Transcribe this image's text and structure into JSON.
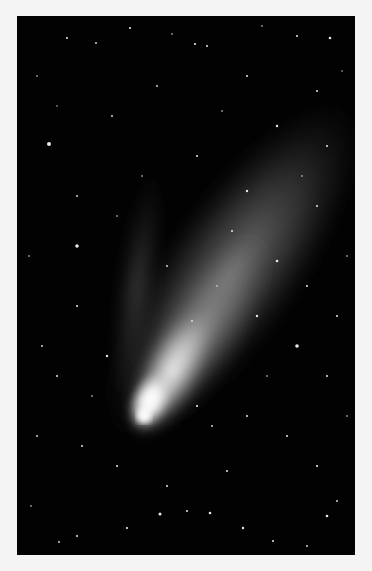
{
  "image": {
    "subject": "Comet with bright nucleus and two tails against a starfield",
    "alt": "Comet photograph",
    "colors": {
      "background_page": "#f4f4f4",
      "sky": "#020202",
      "nucleus": "#ffffff",
      "dust_tail": "#bdbdbd",
      "ion_tail": "#8a8a8a",
      "stars": "#e8e8e8"
    }
  }
}
